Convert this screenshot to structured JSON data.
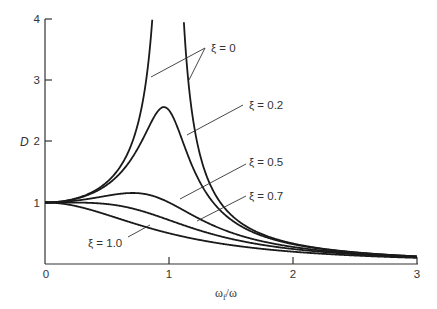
{
  "chart_data": {
    "type": "line",
    "title": "",
    "xlabel": "ω_f/ω",
    "ylabel": "D",
    "xlim": [
      0,
      3
    ],
    "ylim": [
      0,
      4
    ],
    "grid": false,
    "x_ticks": [
      "0",
      "1",
      "2",
      "3"
    ],
    "y_ticks": [
      "1",
      "2",
      "3",
      "4"
    ],
    "formula": "D = 1 / sqrt((1 - r^2)^2 + (2*xi*r)^2), r = ω_f/ω",
    "x": [
      0,
      0.25,
      0.5,
      0.75,
      0.9,
      1.0,
      1.1,
      1.25,
      1.5,
      2.0,
      2.5,
      3.0
    ],
    "series": [
      {
        "name": "ξ = 0",
        "xi": 0,
        "values": [
          1.0,
          1.07,
          1.33,
          2.29,
          5.26,
          null,
          4.76,
          1.78,
          0.8,
          0.33,
          0.19,
          0.125
        ]
      },
      {
        "name": "ξ = 0.2",
        "xi": 0.2,
        "values": [
          1.0,
          1.06,
          1.28,
          1.87,
          2.4,
          2.5,
          2.15,
          1.41,
          0.73,
          0.32,
          0.18,
          0.12
        ]
      },
      {
        "name": "ξ = 0.5",
        "xi": 0.5,
        "values": [
          1.0,
          1.03,
          1.11,
          1.19,
          1.1,
          1.0,
          0.88,
          0.69,
          0.49,
          0.28,
          0.17,
          0.12
        ]
      },
      {
        "name": "ξ = 0.7",
        "xi": 0.7,
        "values": [
          1.0,
          0.99,
          0.97,
          0.88,
          0.79,
          0.71,
          0.64,
          0.54,
          0.41,
          0.25,
          0.16,
          0.11
        ]
      },
      {
        "name": "ξ = 1.0",
        "xi": 1.0,
        "values": [
          1.0,
          0.94,
          0.8,
          0.64,
          0.55,
          0.5,
          0.45,
          0.39,
          0.31,
          0.2,
          0.14,
          0.1
        ]
      }
    ],
    "annotations": [
      {
        "text": "ξ = 0",
        "points_to": [
          "left branch near r≈0.85",
          "right branch near r≈1.15"
        ]
      },
      {
        "text": "ξ = 0.2",
        "points_to": "descending branch near r≈1.15"
      },
      {
        "text": "ξ = 0.5",
        "points_to": "curve near r≈1.1"
      },
      {
        "text": "ξ = 0.7",
        "points_to": "curve near r≈1.2"
      },
      {
        "text": "ξ = 1.0",
        "points_to": "curve near r≈0.85"
      }
    ]
  },
  "axes": {
    "x_ticks": [
      "0",
      "1",
      "2",
      "3"
    ],
    "y_ticks": [
      "1",
      "2",
      "3",
      "4"
    ],
    "xlabel_main": "ω",
    "xlabel_sub": "f",
    "xlabel_tail": "/ω",
    "ylabel": "D"
  },
  "legend": {
    "xi0": "ξ = 0",
    "xi02": "ξ = 0.2",
    "xi05": "ξ = 0.5",
    "xi07": "ξ = 0.7",
    "xi10": "ξ = 1.0"
  }
}
